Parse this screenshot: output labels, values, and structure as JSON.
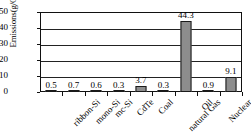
{
  "chart_data": {
    "type": "bar",
    "title": "",
    "xlabel": "",
    "ylabel": "Emissions(g/GW·h)",
    "ylim": [
      0,
      50
    ],
    "yticks": [
      0,
      10,
      20,
      30,
      40,
      50
    ],
    "ytick_labels": [
      "0",
      "10",
      "20",
      "30",
      "40",
      "50"
    ],
    "grid": true,
    "legend": "none",
    "categories": [
      "ribbon-Si",
      "mono-Si",
      "mc-Si",
      "CdTe",
      "Coal",
      "natural Gas",
      "Oil",
      "Nuclear",
      "UCTEavg."
    ],
    "values": [
      0.5,
      0.7,
      0.6,
      0.3,
      3.7,
      0.3,
      44.3,
      0.9,
      9.1
    ],
    "value_labels": [
      "0.5",
      "0.7",
      "0.6",
      "0.3",
      "3.7",
      "0.3",
      "44.3",
      "0.9",
      "9.1"
    ],
    "bar_color": "#8d8d8d",
    "bar_edge_color": "#1a1a1a",
    "axis_color": "#111111"
  }
}
